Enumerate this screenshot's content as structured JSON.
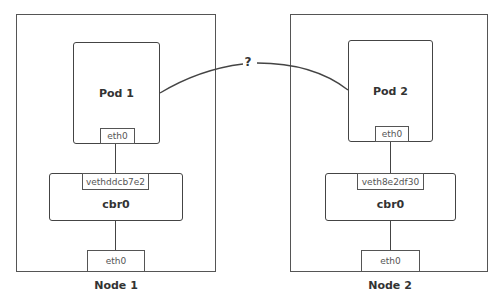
{
  "diagram": {
    "connection_label": "?",
    "nodes": [
      {
        "label": "Node 1",
        "pod": {
          "label": "Pod 1",
          "interface": "eth0"
        },
        "bridge": {
          "label": "cbr0",
          "veth": "vethddcb7e2"
        },
        "host_interface": "eth0"
      },
      {
        "label": "Node 2",
        "pod": {
          "label": "Pod 2",
          "interface": "eth0"
        },
        "bridge": {
          "label": "cbr0",
          "veth": "veth8e2df30"
        },
        "host_interface": "eth0"
      }
    ]
  }
}
